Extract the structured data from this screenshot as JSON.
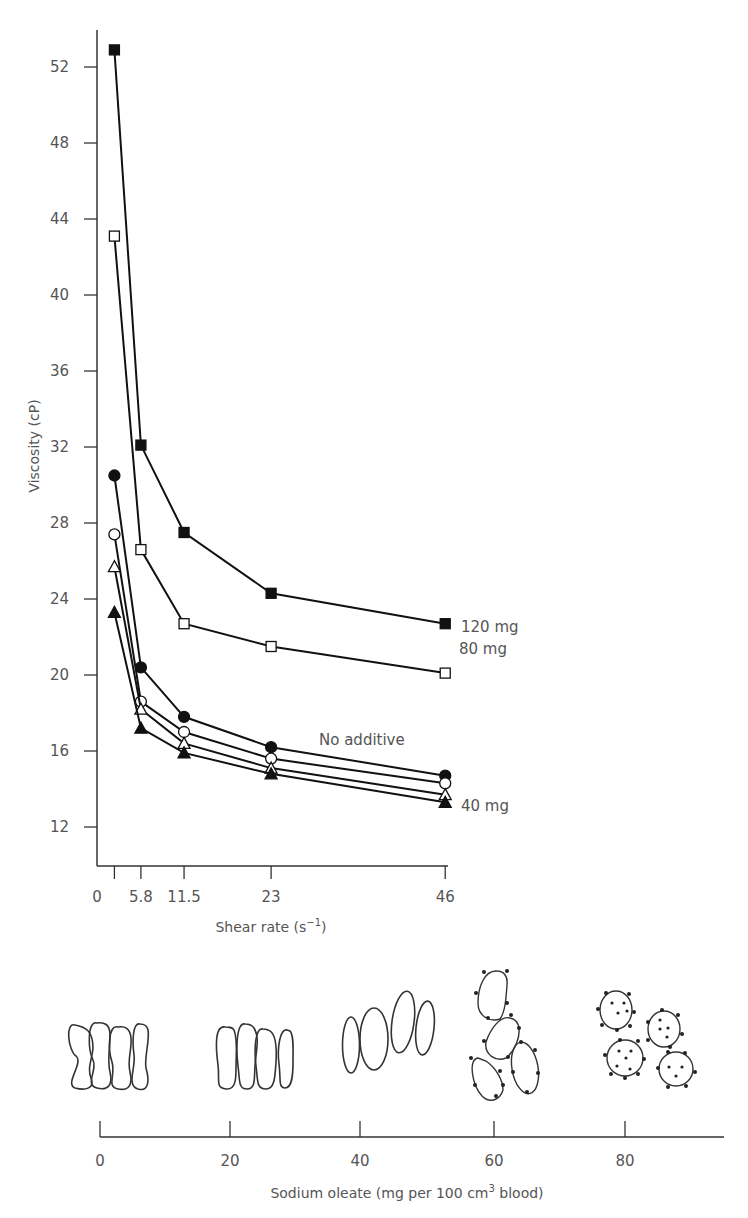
{
  "chart_data": [
    {
      "type": "line",
      "title": "",
      "xlabel": "Shear rate (s⁻¹)",
      "ylabel": "Viscosity (cP)",
      "x_ticks": [
        "0",
        "5.8",
        "11.5",
        "23",
        "46"
      ],
      "y_ticks": [
        "12",
        "16",
        "20",
        "24",
        "28",
        "32",
        "36",
        "40",
        "44",
        "48",
        "52"
      ],
      "ylim": [
        10,
        54
      ],
      "xlim": [
        0,
        46
      ],
      "grid": false,
      "legend_position": "inline labels at line ends",
      "x": [
        2.3,
        5.8,
        11.5,
        23,
        46
      ],
      "series": [
        {
          "name": "120 mg",
          "marker": "filled-square",
          "values": [
            52.9,
            32.1,
            27.5,
            24.3,
            22.7
          ]
        },
        {
          "name": "80 mg",
          "marker": "open-square",
          "values": [
            43.1,
            26.6,
            22.7,
            21.5,
            20.1
          ]
        },
        {
          "name": "No additive",
          "marker": "filled-circle",
          "values": [
            30.5,
            20.4,
            17.8,
            16.2,
            14.7
          ]
        },
        {
          "name": "20 mg",
          "marker": "open-circle",
          "values": [
            27.4,
            18.6,
            17.0,
            15.6,
            14.3
          ]
        },
        {
          "name": "60 mg",
          "marker": "open-triangle",
          "values": [
            25.7,
            18.2,
            16.4,
            15.1,
            13.7
          ]
        },
        {
          "name": "40 mg",
          "marker": "filled-triangle",
          "values": [
            23.3,
            17.2,
            15.9,
            14.8,
            13.3
          ]
        }
      ],
      "annotations": [
        "120 mg",
        "80 mg",
        "No additive",
        "40 mg"
      ]
    },
    {
      "type": "diagram-scale",
      "xlabel": "Sodium oleate (mg per 100 cm³ blood)",
      "x_ticks": [
        "0",
        "20",
        "40",
        "60",
        "80"
      ],
      "cell_stages": [
        {
          "concentration": 0,
          "description": "4 normal biconcave cells side by side (stacked)"
        },
        {
          "concentration": 20,
          "description": "4 slightly swollen cells side by side"
        },
        {
          "concentration": 40,
          "description": "4 swollen ovoid cells"
        },
        {
          "concentration": 60,
          "description": "4 separated irregular cells with surface spicules"
        },
        {
          "concentration": 80,
          "description": "4 spherical echinocytes with spicules and dots"
        }
      ]
    }
  ],
  "labels": {
    "y_axis_title": "Viscosity (cP)",
    "x_axis_title_main": "Shear rate (s",
    "x_axis_title_sup": "−1",
    "x_axis_title_end": ")",
    "series_120": "120 mg",
    "series_80": "80 mg",
    "series_none": "No additive",
    "series_40": "40 mg",
    "scale_title_main": "Sodium oleate (mg per 100 cm",
    "scale_title_sup": "3",
    "scale_title_end": " blood)"
  },
  "y_ticks": [
    "52",
    "48",
    "44",
    "40",
    "36",
    "32",
    "28",
    "24",
    "20",
    "16",
    "12"
  ],
  "x_ticks": [
    "0",
    "5.8",
    "11.5",
    "23",
    "46"
  ],
  "scale_ticks": [
    "0",
    "20",
    "40",
    "60",
    "80"
  ]
}
